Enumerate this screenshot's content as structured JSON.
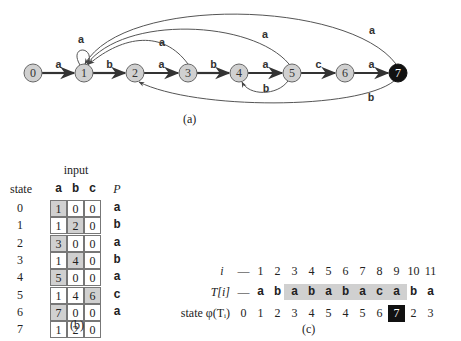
{
  "automaton": {
    "states": [
      "0",
      "1",
      "2",
      "3",
      "4",
      "5",
      "6",
      "7"
    ],
    "accepting_state": "7",
    "forward_edges": [
      {
        "from": "0",
        "to": "1",
        "label": "a"
      },
      {
        "from": "1",
        "to": "2",
        "label": "b"
      },
      {
        "from": "2",
        "to": "3",
        "label": "a"
      },
      {
        "from": "3",
        "to": "4",
        "label": "b"
      },
      {
        "from": "4",
        "to": "5",
        "label": "a"
      },
      {
        "from": "5",
        "to": "6",
        "label": "c"
      },
      {
        "from": "6",
        "to": "7",
        "label": "a"
      }
    ],
    "back_edges": [
      {
        "from": "1",
        "to": "1",
        "label": "a"
      },
      {
        "from": "3",
        "to": "1",
        "label": "a"
      },
      {
        "from": "5",
        "to": "1",
        "label": "a"
      },
      {
        "from": "7",
        "to": "1",
        "label": "a"
      },
      {
        "from": "5",
        "to": "4",
        "label": "b"
      },
      {
        "from": "7",
        "to": "2",
        "label": "b"
      }
    ],
    "caption": "(a)"
  },
  "transition_table": {
    "input_label": "input",
    "state_header": "state",
    "symbols": [
      "a",
      "b",
      "c"
    ],
    "pattern_header": "P",
    "rows": [
      {
        "state": "0",
        "a": "1",
        "b": "0",
        "c": "0",
        "p": "a",
        "hl": "a"
      },
      {
        "state": "1",
        "a": "1",
        "b": "2",
        "c": "0",
        "p": "b",
        "hl": "b"
      },
      {
        "state": "2",
        "a": "3",
        "b": "0",
        "c": "0",
        "p": "a",
        "hl": "a"
      },
      {
        "state": "3",
        "a": "1",
        "b": "4",
        "c": "0",
        "p": "b",
        "hl": "b"
      },
      {
        "state": "4",
        "a": "5",
        "b": "0",
        "c": "0",
        "p": "a",
        "hl": "a"
      },
      {
        "state": "5",
        "a": "1",
        "b": "4",
        "c": "6",
        "p": "c",
        "hl": "c"
      },
      {
        "state": "6",
        "a": "7",
        "b": "0",
        "c": "0",
        "p": "a",
        "hl": "a"
      },
      {
        "state": "7",
        "a": "1",
        "b": "2",
        "c": "0",
        "p": "",
        "hl": ""
      }
    ],
    "caption": "(b)"
  },
  "trace": {
    "row_labels": {
      "i": "i",
      "t": "T[i]",
      "state": "state φ(Tᵢ)"
    },
    "i": [
      "—",
      "1",
      "2",
      "3",
      "4",
      "5",
      "6",
      "7",
      "8",
      "9",
      "10",
      "11"
    ],
    "t": [
      "—",
      "a",
      "b",
      "a",
      "b",
      "a",
      "b",
      "a",
      "c",
      "a",
      "b",
      "a"
    ],
    "state": [
      "0",
      "1",
      "2",
      "3",
      "4",
      "5",
      "4",
      "5",
      "6",
      "7",
      "2",
      "3"
    ],
    "highlight_range": [
      3,
      9
    ],
    "match_index": 9,
    "caption": "(c)"
  }
}
